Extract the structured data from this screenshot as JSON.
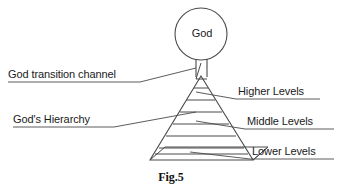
{
  "figure": {
    "caption": "Fig.5",
    "center_node_label": "God",
    "left_annotations": [
      {
        "id": "god-transition-channel",
        "label": "God transition channel",
        "underlined": true
      },
      {
        "id": "gods-hierarchy",
        "label": "God's Hierarchy",
        "underlined": true
      }
    ],
    "right_annotations": [
      {
        "id": "higher-levels",
        "label": "Higher Levels",
        "underlined": true
      },
      {
        "id": "middle-levels",
        "label": "Middle Levels",
        "underlined": true
      },
      {
        "id": "lower-levels",
        "label": "Lower Levels",
        "underlined": true
      }
    ],
    "colors": {
      "stroke": "#3c3c3c",
      "text": "#1a1a1a",
      "background": "#ffffff"
    },
    "shapes": {
      "circle": {
        "cx": 201,
        "cy": 34,
        "r": 26
      },
      "channel": {
        "x": 196,
        "y": 60,
        "width": 11,
        "height": 18
      },
      "pyramid": {
        "apex_x": 201,
        "apex_y": 76,
        "base_left_x": 150,
        "base_right_x": 253,
        "base_y": 160
      },
      "level_line_count": 7
    }
  }
}
